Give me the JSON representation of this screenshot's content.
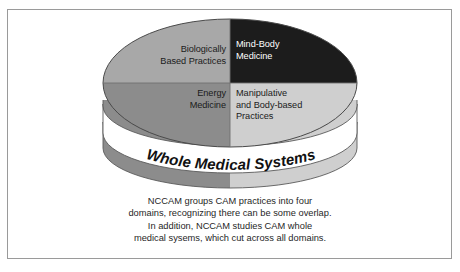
{
  "figure": {
    "frame_border_color": "#9a9a9a",
    "background_color": "#ffffff"
  },
  "diagram": {
    "type": "3d-cylinder-pie",
    "title_band": {
      "label": "Whole Medical Systems",
      "band_color": "#ffffff",
      "text_color": "#111111"
    },
    "quadrants": [
      {
        "id": "biologically-based-practices",
        "label": "Biologically\nBased Practices",
        "position": "top-left",
        "fill_color": "#a8a8a8",
        "text_color": "#1b1b1b"
      },
      {
        "id": "mind-body-medicine",
        "label": "Mind-Body\nMedicine",
        "position": "top-right",
        "fill_color": "#1c1c1c",
        "text_color": "#ffffff"
      },
      {
        "id": "energy-medicine",
        "label": "Energy\nMedicine",
        "position": "bottom-left",
        "fill_color": "#8c8c8c",
        "text_color": "#1b1b1b"
      },
      {
        "id": "manipulative-and-body-based-practices",
        "label": "Manipulative\nand Body-based\nPractices",
        "position": "bottom-right",
        "fill_color": "#cfcfcf",
        "text_color": "#1b1b1b"
      }
    ],
    "side_bands": {
      "rim_left_color": "#8c8c8c",
      "rim_right_color": "#cfcfcf",
      "base_left_color": "#8c8c8c",
      "base_right_color": "#cfcfcf",
      "outline_color": "#5a5a5a"
    }
  },
  "caption": {
    "lines": [
      "NCCAM groups CAM practices into four",
      "domains, recognizing there can be some overlap.",
      "In addition, NCCAM studies CAM whole",
      "medical sysems, which cut across all domains."
    ]
  }
}
